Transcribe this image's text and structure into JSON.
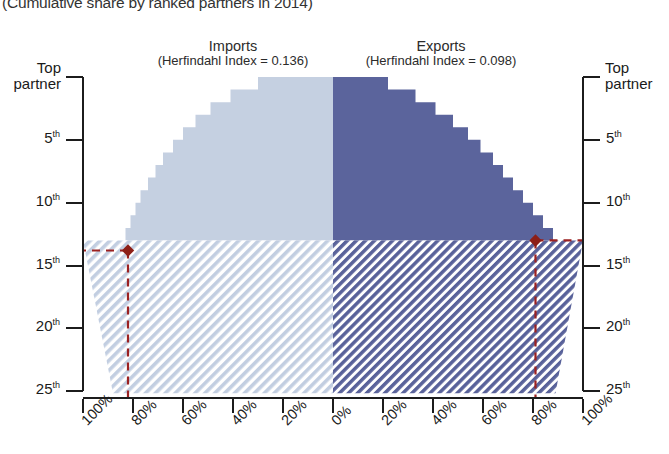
{
  "title": "(Cumulative share by ranked partners in 2014)",
  "panels": {
    "imports": {
      "name": "Imports",
      "index_label": "(Herfindahl Index = 0.136)"
    },
    "exports": {
      "name": "Exports",
      "index_label": "(Herfindahl Index = 0.098)"
    }
  },
  "axes": {
    "y_left_title": "Top partner",
    "y_right_title": "Top partner",
    "y_ticks": [
      "5",
      "10",
      "15",
      "20",
      "25"
    ],
    "y_suffix": "th",
    "x_ticks_left": [
      "100%",
      "80%",
      "60%",
      "40%",
      "20%",
      "0%"
    ],
    "x_ticks_right": [
      "20%",
      "40%",
      "60%",
      "80%",
      "100%"
    ]
  },
  "colors": {
    "imports_fill": "#c5d0e1",
    "imports_hatch": "#b9c8de",
    "exports_fill": "#5b649c",
    "exports_hatch": "#5b649c",
    "reference_line": "#9b2121",
    "axis": "#1c1c1c"
  },
  "reference": {
    "left_rank": 13.8,
    "left_value_percent": 82,
    "right_rank": 13.0,
    "right_value_percent": 81,
    "marker": "diamond",
    "style": "dashed"
  },
  "chart_data": {
    "type": "area",
    "title": "(Cumulative share by ranked partners in 2014)",
    "xlabel": "",
    "ylabel": "Partner rank",
    "orientation": "horizontal-mirrored-steps",
    "xlim": [
      -100,
      100
    ],
    "ylim": [
      1,
      25
    ],
    "grid": false,
    "legend": "none",
    "categories": [
      "Top partner",
      "2nd",
      "3rd",
      "4th",
      "5th",
      "6th",
      "7th",
      "8th",
      "9th",
      "10th",
      "11th",
      "12th",
      "13th",
      "14th",
      "15th",
      "16th",
      "17th",
      "18th",
      "19th",
      "20th",
      "21st",
      "22nd",
      "23rd",
      "24th",
      "25th"
    ],
    "series": [
      {
        "name": "Imports",
        "herfindahl_index": 0.136,
        "direction": "left",
        "color": "#c5d0e1",
        "cumulative_percent": [
          30,
          41,
          49,
          55,
          60,
          64,
          68,
          71,
          74,
          77,
          79,
          81,
          83,
          100,
          100,
          100,
          100,
          100,
          100,
          100,
          100,
          100,
          100,
          100,
          100
        ]
      },
      {
        "name": "Exports",
        "herfindahl_index": 0.098,
        "direction": "right",
        "color": "#5b649c",
        "cumulative_percent": [
          22,
          33,
          41,
          48,
          54,
          59,
          64,
          68,
          72,
          76,
          80,
          84,
          88,
          100,
          100,
          100,
          100,
          100,
          100,
          100,
          100,
          100,
          100,
          100,
          100
        ]
      }
    ],
    "annotations": [
      {
        "label": "reference marker",
        "series": "Imports",
        "rank": 14,
        "percent": 82
      },
      {
        "label": "reference marker",
        "series": "Exports",
        "rank": 13,
        "percent": 81
      }
    ]
  }
}
